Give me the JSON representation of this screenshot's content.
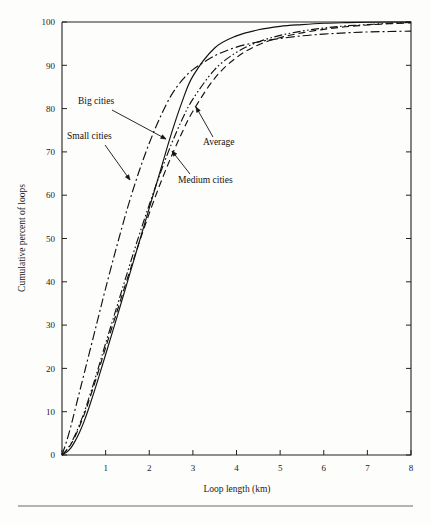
{
  "figure": {
    "background_color": "#fdfdfb",
    "ink_color": "#111111",
    "plot_frame": {
      "left": 62,
      "top": 22,
      "right": 411,
      "bottom": 455
    }
  },
  "chart_data": {
    "type": "line",
    "title": "",
    "subtitle": "",
    "xlabel": "Loop length (km)",
    "ylabel": "Cumulative percent of loops",
    "xlim": [
      0,
      8
    ],
    "ylim": [
      0,
      100
    ],
    "xticks": [
      0,
      1,
      2,
      3,
      4,
      5,
      6,
      7,
      8
    ],
    "xticklabels": [
      "",
      "1",
      "2",
      "3",
      "4",
      "5",
      "6",
      "7",
      "8"
    ],
    "yticks": [
      0,
      10,
      20,
      30,
      40,
      50,
      60,
      70,
      80,
      90,
      100
    ],
    "yticklabels": [
      "0",
      "10",
      "20",
      "30",
      "40",
      "50",
      "60",
      "70",
      "80",
      "90",
      "100"
    ],
    "grid": false,
    "legend": "none (inline annotated labels with leader arrows)",
    "x": [
      0,
      0.1,
      0.2,
      0.3,
      0.4,
      0.5,
      0.6,
      0.8,
      1.0,
      1.25,
      1.5,
      1.75,
      2.0,
      2.25,
      2.5,
      2.75,
      3.0,
      3.5,
      4.0,
      4.5,
      5.0,
      5.5,
      6.0,
      6.5,
      7.0,
      7.5,
      8.0
    ],
    "series": [
      {
        "name": "Small cities",
        "linestyle": "dash-dot",
        "dasharray": "9,3,2,3",
        "values": [
          0,
          3,
          6.5,
          10.5,
          14.5,
          18.5,
          22.5,
          30.5,
          38.5,
          48,
          57,
          65,
          72,
          78,
          83,
          86.5,
          89,
          92.2,
          94.2,
          95.4,
          96.2,
          96.8,
          97.2,
          97.5,
          97.7,
          97.8,
          97.9
        ]
      },
      {
        "name": "Big cities",
        "linestyle": "solid",
        "dasharray": "none",
        "values": [
          0,
          0.6,
          1.6,
          3.2,
          5.2,
          7.6,
          10.4,
          16.6,
          23.2,
          31.5,
          40,
          48.5,
          57,
          65.5,
          74,
          81.5,
          87.5,
          94,
          96.8,
          98.2,
          99,
          99.4,
          99.7,
          99.85,
          99.95,
          100,
          100
        ]
      },
      {
        "name": "Average",
        "linestyle": "dash-dot-dot",
        "dasharray": "8,2.5,1.6,2.5,1.6,2.5",
        "values": [
          0,
          1.1,
          2.6,
          4.6,
          7.0,
          9.6,
          12.6,
          19.0,
          25.8,
          34.0,
          42.2,
          50.2,
          57.8,
          65.0,
          71.6,
          77.4,
          82.2,
          89.0,
          93.0,
          95.4,
          96.9,
          97.9,
          98.6,
          99.1,
          99.4,
          99.7,
          99.9
        ]
      },
      {
        "name": "Medium cities",
        "linestyle": "dashed",
        "dasharray": "7,4",
        "values": [
          0,
          1.0,
          2.4,
          4.3,
          6.6,
          9.1,
          12.0,
          18.2,
          24.8,
          32.8,
          40.8,
          48.5,
          55.8,
          62.6,
          68.8,
          74.4,
          79.4,
          87.0,
          91.8,
          94.7,
          96.4,
          97.5,
          98.3,
          98.9,
          99.3,
          99.6,
          99.8
        ]
      }
    ],
    "annotations": [
      {
        "text": "Big cities",
        "label_x": 78,
        "label_y": 104,
        "arrow_from_x": 112,
        "arrow_from_y": 110,
        "arrow_to_x": 166,
        "arrow_to_y": 139
      },
      {
        "text": "Small cities",
        "label_x": 67,
        "label_y": 139,
        "arrow_from_x": 105,
        "arrow_from_y": 145,
        "arrow_to_x": 130,
        "arrow_to_y": 180
      },
      {
        "text": "Average",
        "label_x": 203,
        "label_y": 145,
        "arrow_from_x": 213,
        "arrow_from_y": 137,
        "arrow_to_x": 196,
        "arrow_to_y": 107
      },
      {
        "text": "Medium cities",
        "label_x": 178,
        "label_y": 183,
        "arrow_from_x": 190,
        "arrow_from_y": 174,
        "arrow_to_x": 172,
        "arrow_to_y": 151
      }
    ]
  },
  "footer": {
    "rule_visible": true,
    "caption_fragment": ""
  }
}
